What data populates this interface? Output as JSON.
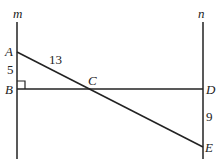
{
  "diagram": {
    "lines": [
      {
        "name": "m",
        "label": "m"
      },
      {
        "name": "n",
        "label": "n"
      }
    ],
    "points": {
      "A": "A",
      "B": "B",
      "C": "C",
      "D": "D",
      "E": "E"
    },
    "measurements": {
      "AB": "5",
      "AC": "13",
      "DE": "9"
    },
    "right_angle_at": "B",
    "stroke_color": "#222222"
  }
}
